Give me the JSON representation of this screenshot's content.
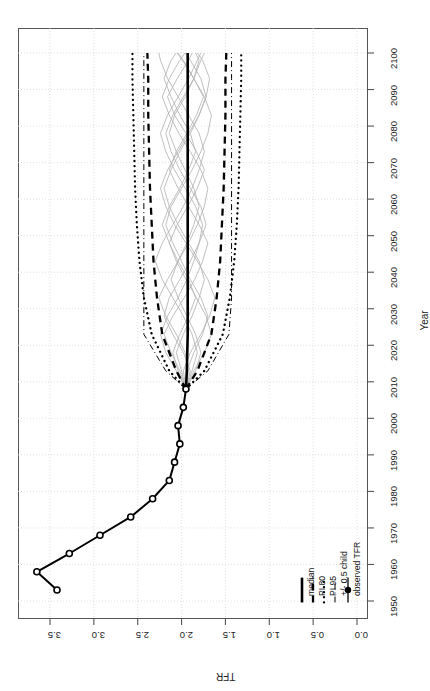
{
  "chart_data": {
    "type": "line",
    "title": "",
    "orientation": "rotated-90",
    "xlabel": "Year",
    "ylabel": "TFR",
    "xlim": [
      1950,
      2100
    ],
    "ylim": [
      0.0,
      3.75
    ],
    "grid": true,
    "x_ticks": [
      1950,
      1960,
      1970,
      1980,
      1990,
      2000,
      2010,
      2020,
      2030,
      2040,
      2050,
      2060,
      2070,
      2080,
      2090,
      2100
    ],
    "y_ticks": [
      "0.0",
      "0.5",
      "1.0",
      "1.5",
      "2.0",
      "2.5",
      "3.0",
      "3.5"
    ],
    "y_tick_values": [
      0.0,
      0.5,
      1.0,
      1.5,
      2.0,
      2.5,
      3.0,
      3.5
    ],
    "legend_position": "bottom-right",
    "legend": [
      {
        "label": "median",
        "style": "solid-thick"
      },
      {
        "label": "PI 80",
        "style": "dashed"
      },
      {
        "label": "PI 95",
        "style": "dotted"
      },
      {
        "label": "+/- 0.5 child",
        "style": "dashdot"
      },
      {
        "label": "observed TFR",
        "style": "solid-with-point"
      }
    ],
    "series": [
      {
        "name": "observed TFR",
        "style": "solid-with-open-circles",
        "x": [
          1953,
          1958,
          1963,
          1968,
          1973,
          1978,
          1983,
          1988,
          1993,
          1998,
          2003,
          2008
        ],
        "values": [
          3.42,
          3.65,
          3.28,
          2.93,
          2.58,
          2.33,
          2.14,
          2.08,
          2.02,
          2.04,
          1.98,
          1.95
        ]
      },
      {
        "name": "median",
        "style": "solid-thick",
        "x": [
          2008,
          2013,
          2023,
          2033,
          2043,
          2053,
          2063,
          2073,
          2083,
          2093,
          2100
        ],
        "values": [
          1.95,
          1.94,
          1.93,
          1.93,
          1.93,
          1.93,
          1.93,
          1.93,
          1.93,
          1.93,
          1.93
        ]
      },
      {
        "name": "PI 80 lower",
        "style": "dashed",
        "x": [
          2008,
          2013,
          2023,
          2033,
          2043,
          2053,
          2063,
          2073,
          2083,
          2093,
          2100
        ],
        "values": [
          1.95,
          1.82,
          1.66,
          1.6,
          1.56,
          1.54,
          1.52,
          1.51,
          1.5,
          1.5,
          1.49
        ]
      },
      {
        "name": "PI 80 upper",
        "style": "dashed",
        "x": [
          2008,
          2013,
          2023,
          2033,
          2043,
          2053,
          2063,
          2073,
          2083,
          2093,
          2100
        ],
        "values": [
          1.95,
          2.06,
          2.22,
          2.28,
          2.32,
          2.34,
          2.36,
          2.37,
          2.38,
          2.38,
          2.39
        ]
      },
      {
        "name": "PI 95 lower",
        "style": "dotted",
        "x": [
          2008,
          2013,
          2023,
          2033,
          2043,
          2053,
          2063,
          2073,
          2083,
          2093,
          2100
        ],
        "values": [
          1.95,
          1.74,
          1.53,
          1.45,
          1.4,
          1.37,
          1.35,
          1.34,
          1.33,
          1.32,
          1.32
        ]
      },
      {
        "name": "PI 95 upper",
        "style": "dotted",
        "x": [
          2008,
          2013,
          2023,
          2033,
          2043,
          2053,
          2063,
          2073,
          2083,
          2093,
          2100
        ],
        "values": [
          1.95,
          2.14,
          2.34,
          2.43,
          2.48,
          2.51,
          2.53,
          2.54,
          2.55,
          2.56,
          2.56
        ]
      },
      {
        "name": "+/- 0.5 child lower",
        "style": "dashdot",
        "x": [
          2008,
          2013,
          2023,
          2033,
          2043,
          2053,
          2063,
          2073,
          2083,
          2093,
          2100
        ],
        "values": [
          1.95,
          1.7,
          1.46,
          1.43,
          1.43,
          1.43,
          1.43,
          1.43,
          1.43,
          1.43,
          1.43
        ]
      },
      {
        "name": "+/- 0.5 child upper",
        "style": "dashdot",
        "x": [
          2008,
          2013,
          2023,
          2033,
          2043,
          2053,
          2063,
          2073,
          2083,
          2093,
          2100
        ],
        "values": [
          1.95,
          2.18,
          2.43,
          2.43,
          2.43,
          2.43,
          2.43,
          2.43,
          2.43,
          2.43,
          2.43
        ]
      }
    ],
    "trajectories": {
      "name": "sample trajectories",
      "color": "#b4b4b4",
      "count": 11,
      "x": [
        2008,
        2013,
        2018,
        2023,
        2028,
        2033,
        2038,
        2043,
        2048,
        2053,
        2058,
        2063,
        2068,
        2073,
        2078,
        2083,
        2088,
        2093,
        2098,
        2100
      ],
      "paths": [
        [
          1.95,
          1.86,
          1.74,
          1.66,
          1.72,
          1.83,
          1.95,
          2.06,
          2.14,
          2.05,
          1.93,
          1.82,
          1.74,
          1.83,
          1.95,
          2.08,
          2.16,
          2.05,
          1.92,
          1.88
        ],
        [
          1.95,
          2.02,
          2.12,
          2.2,
          2.1,
          1.97,
          1.85,
          1.76,
          1.7,
          1.8,
          1.92,
          2.04,
          2.14,
          2.06,
          1.94,
          1.83,
          1.75,
          1.86,
          1.99,
          2.05
        ],
        [
          1.95,
          1.92,
          1.96,
          2.06,
          2.18,
          2.26,
          2.16,
          2.04,
          1.92,
          1.82,
          1.74,
          1.7,
          1.78,
          1.9,
          2.03,
          2.14,
          2.22,
          2.14,
          2.02,
          1.96
        ],
        [
          1.95,
          1.98,
          1.9,
          1.78,
          1.68,
          1.62,
          1.7,
          1.82,
          1.95,
          2.08,
          2.18,
          2.24,
          2.16,
          2.04,
          1.92,
          1.8,
          1.72,
          1.68,
          1.76,
          1.82
        ],
        [
          1.95,
          1.88,
          1.82,
          1.88,
          1.98,
          2.1,
          2.22,
          2.3,
          2.22,
          2.1,
          1.98,
          1.88,
          1.8,
          1.74,
          1.8,
          1.92,
          2.04,
          2.16,
          2.24,
          2.26
        ],
        [
          1.95,
          2.06,
          2.18,
          2.24,
          2.16,
          2.04,
          1.94,
          1.86,
          1.8,
          1.76,
          1.84,
          1.96,
          2.08,
          2.18,
          2.24,
          2.16,
          2.04,
          1.92,
          1.82,
          1.78
        ],
        [
          1.95,
          1.94,
          1.86,
          1.76,
          1.7,
          1.78,
          1.9,
          2.0,
          2.1,
          2.18,
          2.12,
          2.0,
          1.88,
          1.78,
          1.7,
          1.66,
          1.74,
          1.86,
          1.98,
          2.04
        ],
        [
          1.95,
          2.0,
          2.06,
          1.98,
          1.88,
          1.8,
          1.74,
          1.8,
          1.92,
          2.04,
          2.14,
          2.2,
          2.12,
          2.02,
          1.9,
          1.8,
          1.72,
          1.78,
          1.9,
          1.96
        ],
        [
          1.95,
          1.9,
          1.98,
          2.1,
          2.2,
          2.14,
          2.02,
          1.9,
          1.8,
          1.72,
          1.78,
          1.9,
          2.02,
          2.12,
          2.18,
          2.1,
          1.98,
          1.86,
          1.78,
          1.74
        ],
        [
          1.95,
          2.04,
          2.1,
          2.02,
          1.92,
          1.84,
          1.92,
          2.04,
          2.14,
          2.22,
          2.14,
          2.02,
          1.92,
          1.84,
          1.9,
          2.02,
          2.12,
          2.2,
          2.12,
          2.06
        ],
        [
          1.95,
          1.84,
          1.78,
          1.84,
          1.94,
          2.04,
          2.12,
          2.04,
          1.94,
          1.86,
          1.8,
          1.86,
          1.96,
          2.06,
          2.14,
          2.08,
          1.96,
          1.86,
          1.8,
          1.84
        ]
      ]
    }
  }
}
